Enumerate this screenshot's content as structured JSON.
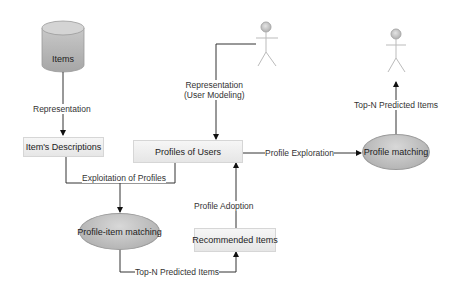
{
  "diagram": {
    "nodes": {
      "items": "Items",
      "item_descriptions": "Item's Descriptions",
      "profiles_of_users": "Profiles of Users",
      "profile_item_matching": "Profile-item matching",
      "recommended_items": "Recommended Items",
      "profile_matching": "Profile matching"
    },
    "edges": {
      "representation": "Representation",
      "representation_user_line1": "Representation",
      "representation_user_line2": "(User Modeling)",
      "exploitation_of_profiles": "Exploitation of Profiles",
      "top_n_predicted_items_bottom": "Top-N Predicted Items",
      "profile_adoption": "Profile Adoption",
      "profile_exploration": "Profile Exploration",
      "top_n_predicted_items_right": "Top-N Predicted Items"
    },
    "colors": {
      "box_fill": "#eeeeee",
      "ellipse_fill": "#bcbcbc",
      "line": "#333333",
      "actor": "#bbbbbb"
    }
  }
}
